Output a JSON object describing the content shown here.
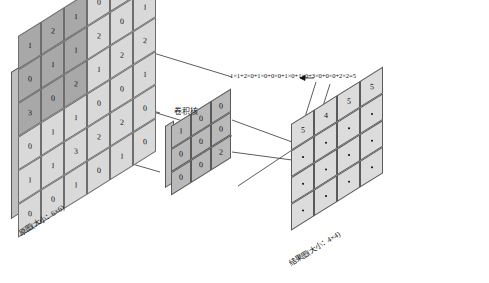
{
  "figure": {
    "type": "convolution-diagram",
    "title_text": ""
  },
  "source": {
    "label": "原图(大小：6×6)",
    "rows": 6,
    "cols": 6,
    "values": [
      [
        1,
        2,
        1,
        0,
        2,
        3
      ],
      [
        0,
        1,
        1,
        2,
        0,
        1
      ],
      [
        3,
        0,
        2,
        1,
        2,
        2
      ],
      [
        0,
        1,
        1,
        0,
        0,
        1
      ],
      [
        1,
        1,
        3,
        2,
        2,
        0
      ],
      [
        0,
        0,
        1,
        0,
        1,
        0
      ]
    ],
    "highlight_shades": [
      [
        "dark",
        "dark",
        "dark",
        "light",
        "light",
        "light"
      ],
      [
        "dark",
        "dark",
        "dark",
        "light",
        "light",
        "light"
      ],
      [
        "dark",
        "dark",
        "dark",
        "light",
        "light",
        "light"
      ],
      [
        "light",
        "light",
        "light",
        "light",
        "light",
        "light"
      ],
      [
        "light",
        "light",
        "light",
        "light",
        "light",
        "light"
      ],
      [
        "light",
        "light",
        "light",
        "light",
        "light",
        "light"
      ]
    ]
  },
  "kernel": {
    "label": "卷积核",
    "rows": 3,
    "cols": 3,
    "values": [
      [
        1,
        0,
        0
      ],
      [
        0,
        0,
        0
      ],
      [
        0,
        0,
        2
      ]
    ]
  },
  "result": {
    "label": "结果图(大小：4×4)",
    "rows": 4,
    "cols": 4,
    "values": [
      [
        "5",
        "4",
        "5",
        "5"
      ],
      [
        "·",
        "·",
        "·",
        "·"
      ],
      [
        "·",
        "·",
        "·",
        "·"
      ],
      [
        "·",
        "·",
        "·",
        "·"
      ]
    ]
  },
  "annotation": {
    "formula": "1×1+2×0+1×0+0×0+1×0+1×0+3×0+0×0+2×2=5"
  },
  "colors": {
    "cell_light": "#d9d9d9",
    "cell_dark": "#a8a8a8",
    "kernel_fill": "#b9b9b9",
    "result_fill": "#dcdcdc",
    "stroke": "#555555",
    "text": "#111111"
  },
  "chart_data": {
    "type": "table",
    "series": [
      {
        "name": "原图(大小：6×6)",
        "values": [
          [
            1,
            2,
            1,
            0,
            2,
            3
          ],
          [
            0,
            1,
            1,
            2,
            0,
            1
          ],
          [
            3,
            0,
            2,
            1,
            2,
            2
          ],
          [
            0,
            1,
            1,
            0,
            0,
            1
          ],
          [
            1,
            1,
            3,
            2,
            2,
            0
          ],
          [
            0,
            0,
            1,
            0,
            1,
            0
          ]
        ]
      },
      {
        "name": "卷积核",
        "values": [
          [
            1,
            0,
            0
          ],
          [
            0,
            0,
            0
          ],
          [
            0,
            0,
            2
          ]
        ]
      },
      {
        "name": "结果图(大小：4×4)",
        "values": [
          [
            5,
            4,
            5,
            5
          ],
          [
            null,
            null,
            null,
            null
          ],
          [
            null,
            null,
            null,
            null
          ],
          [
            null,
            null,
            null,
            null
          ]
        ]
      }
    ],
    "annotations": [
      "1×1+2×0+1×0+0×0+1×0+1×0+3×0+0×0+2×2=5"
    ]
  }
}
